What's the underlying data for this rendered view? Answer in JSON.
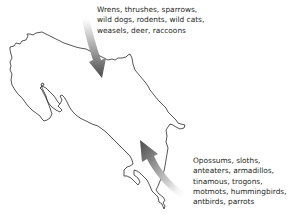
{
  "figure": {
    "region_outline": "Costa Rica",
    "north_label": {
      "lines": [
        "Wrens, thrushes, sparrows,",
        "wild dogs, rodents, wild cats,",
        "weasels, deer, raccoons"
      ]
    },
    "south_label": {
      "lines": [
        "Opossums, sloths,",
        "anteaters, armadillos,",
        "tinamous, trogons,",
        "motmots, hummingbirds,",
        "antbirds, parrots"
      ]
    },
    "arrows": [
      {
        "name": "north-arrow",
        "direction": "southward"
      },
      {
        "name": "south-arrow",
        "direction": "northward"
      }
    ],
    "colors": {
      "outline": "#2b2b2b",
      "arrow_dark": "#4a4a4a",
      "arrow_light": "#e8e8e8",
      "text": "#231f20"
    }
  }
}
